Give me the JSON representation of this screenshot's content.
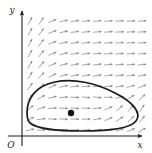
{
  "figure": {
    "title": "",
    "type": "phase-plane-direction-field",
    "background_color": "#ffffff",
    "width": 152,
    "height": 153
  },
  "axes": {
    "x_label": "x",
    "y_label": "y",
    "origin_label": "O",
    "axis_color": "#1a1a1a",
    "x_axis_y_px": 136,
    "y_axis_x_px": 22,
    "x_axis_arrow": true,
    "y_axis_arrow": true
  },
  "chart_data": {
    "type": "scatter",
    "xlabel": "x",
    "ylabel": "y",
    "xlim": [
      0,
      11
    ],
    "ylim": [
      0,
      11
    ],
    "grid": false,
    "legend": "none",
    "field_color": "#8a8a8a",
    "orbit_color": "#1a1a1a",
    "equilibrium_point": {
      "label": "",
      "x_px": 71,
      "y_px": 113,
      "radius_px": 3.2,
      "color": "#111111"
    },
    "closed_orbit": {
      "label": "limit cycle",
      "stroke_width": 1.7,
      "path": "M 27 113 C 27 98, 36 86, 55 82 C 73 78, 96 83, 115 93 C 133 102, 142 113, 136 121 C 130 129, 108 131, 82 131 C 56 131, 36 128, 30 123 C 27 120, 27 117, 27 113 Z"
    },
    "field_grid": {
      "cols": 11,
      "rows": 11,
      "x_start_px": 30,
      "x_step_px": 11.2,
      "y_start_px": 21,
      "y_step_px": 10.9,
      "arrow_len_px": 8.5
    },
    "field_angles_deg": [
      [
        -62,
        -58,
        -20,
        -12,
        -8,
        -6,
        -5,
        -4,
        -3,
        -3,
        -3
      ],
      [
        -62,
        -56,
        -20,
        -12,
        -8,
        -6,
        -5,
        -4,
        -3,
        -3,
        -3
      ],
      [
        -62,
        -54,
        -20,
        -12,
        -9,
        -7,
        -5,
        -4,
        -4,
        -3,
        -3
      ],
      [
        -62,
        -52,
        -22,
        -13,
        -9,
        -7,
        -6,
        -5,
        -4,
        -4,
        -4
      ],
      [
        -60,
        -50,
        -24,
        -14,
        -10,
        -8,
        -7,
        -6,
        -5,
        -5,
        -5
      ],
      [
        -58,
        -46,
        -26,
        -16,
        -11,
        -9,
        -8,
        -8,
        -8,
        -8,
        -9
      ],
      [
        -54,
        -40,
        -24,
        -14,
        -8,
        -4,
        -2,
        -4,
        -10,
        -16,
        -22
      ],
      [
        -48,
        -30,
        -14,
        -4,
        2,
        6,
        6,
        0,
        -14,
        -30,
        -42
      ],
      [
        -40,
        -18,
        -4,
        2,
        4,
        2,
        -6,
        -22,
        -40,
        -52,
        -58
      ],
      [
        -28,
        -8,
        2,
        4,
        2,
        -2,
        -10,
        -22,
        -34,
        -44,
        -50
      ],
      [
        -14,
        -2,
        2,
        2,
        0,
        -2,
        -6,
        -12,
        -18,
        -24,
        -28
      ]
    ]
  }
}
